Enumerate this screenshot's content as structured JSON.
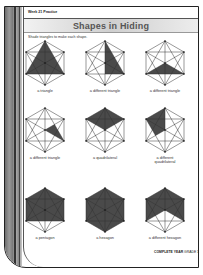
{
  "header": {
    "week": "Week 21 Practice",
    "title": "Shapes in Hiding",
    "instruction": "Shade triangles to make each shape."
  },
  "shapes": [
    {
      "label": "a triangle",
      "cx": 45,
      "cy": 63
    },
    {
      "label": "a different triangle",
      "cx": 105,
      "cy": 63
    },
    {
      "label": "a different triangle",
      "cx": 165,
      "cy": 63
    },
    {
      "label": "a different triangle",
      "cx": 45,
      "cy": 130
    },
    {
      "label": "a quadrilateral",
      "cx": 105,
      "cy": 130
    },
    {
      "label": "a different quadrilateral",
      "cx": 165,
      "cy": 130
    },
    {
      "label": "a pentagon",
      "cx": 45,
      "cy": 210
    },
    {
      "label": "a hexagon",
      "cx": 105,
      "cy": 210
    },
    {
      "label": "a different hexagon",
      "cx": 165,
      "cy": 210
    }
  ],
  "footer": {
    "brand": "COMPLETE YEAR",
    "grade": "GRADE 1"
  },
  "colors": {
    "shade": "#4a4a4a",
    "line": "#333333"
  }
}
